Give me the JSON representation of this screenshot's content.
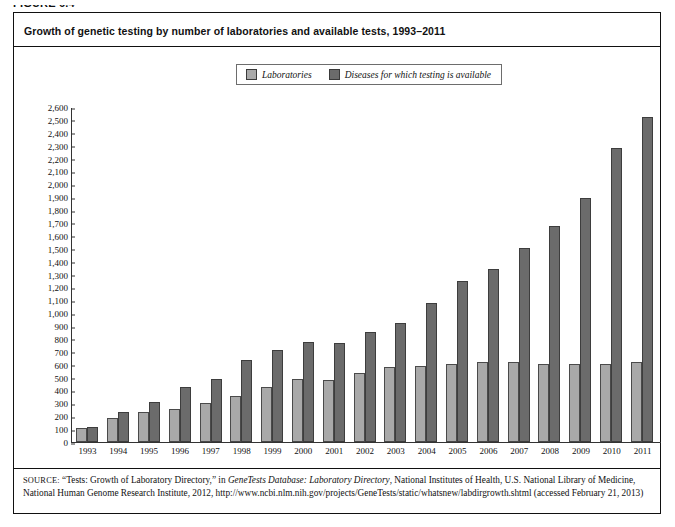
{
  "figure_label": "FIGURE 6.4",
  "title": "Growth of genetic testing by number of laboratories and available tests, 1993–2011",
  "legend": {
    "items": [
      {
        "label": "Laboratories",
        "color": "#a9a9a9"
      },
      {
        "label": "Diseases for which testing is available",
        "color": "#6b6b6b"
      }
    ]
  },
  "source": {
    "label": "SOURCE:",
    "text_1": " “Tests: Growth of Laboratory Directory,” in ",
    "italic_1": "GeneTests Database: Laboratory Directory",
    "text_2": ", National Institutes of Health, U.S. National Library of Medicine, National Human Genome Research Institute, 2012, http://www.ncbi.nlm.nih.gov/projects/GeneTests/static/whatsnew/labdirgrowth.shtml (accessed February 21, 2013)"
  },
  "chart_data": {
    "type": "bar",
    "title": "Growth of genetic testing by number of laboratories and available tests, 1993–2011",
    "xlabel": "",
    "ylabel": "",
    "ylim": [
      0,
      2600
    ],
    "ytick_step": 100,
    "grid": false,
    "legend_position": "top-center",
    "categories": [
      "1993",
      "1994",
      "1995",
      "1996",
      "1997",
      "1998",
      "1999",
      "2000",
      "2001",
      "2002",
      "2003",
      "2004",
      "2005",
      "2006",
      "2007",
      "2008",
      "2009",
      "2010",
      "2011"
    ],
    "ytick_labels": [
      "0",
      "100",
      "200",
      "300",
      "400",
      "500",
      "600",
      "700",
      "800",
      "900",
      "1,000",
      "1,100",
      "1,200",
      "1,300",
      "1,400",
      "1,500",
      "1,600",
      "1,700",
      "1,800",
      "1,900",
      "2,000",
      "2,100",
      "2,200",
      "2,300",
      "2,400",
      "2,500",
      "2,600"
    ],
    "series": [
      {
        "name": "Laboratories",
        "color": "#a9a9a9",
        "values": [
          110,
          185,
          230,
          255,
          300,
          360,
          425,
          490,
          480,
          540,
          585,
          590,
          610,
          620,
          625,
          610,
          608,
          610,
          620
        ]
      },
      {
        "name": "Diseases for which testing is available",
        "color": "#6b6b6b",
        "values": [
          115,
          235,
          310,
          425,
          490,
          635,
          715,
          780,
          770,
          855,
          930,
          1085,
          1250,
          1350,
          1510,
          1680,
          1900,
          2290,
          2530
        ]
      }
    ]
  }
}
